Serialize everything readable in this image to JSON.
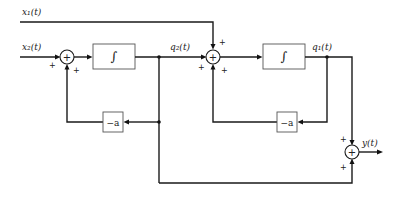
{
  "diagram": {
    "type": "block-diagram",
    "inputs": {
      "x1": "x₁(t)",
      "x2": "x₂(t)"
    },
    "signals": {
      "q2": "q₂(t)",
      "q1": "q₁(t)",
      "y": "y(t)"
    },
    "blocks": {
      "integrator1": "∫",
      "integrator2": "∫",
      "gain1": "−a",
      "gain2": "−a"
    },
    "summers": {
      "sum_glyph": "+",
      "sum1_signs": [
        "+",
        "+"
      ],
      "sum2_signs": [
        "+",
        "+",
        "+"
      ],
      "sum_out_signs": [
        "+",
        "+"
      ]
    },
    "colors": {
      "line": "#1a1a1a",
      "box_border": "#555555",
      "background": "#ffffff"
    }
  }
}
